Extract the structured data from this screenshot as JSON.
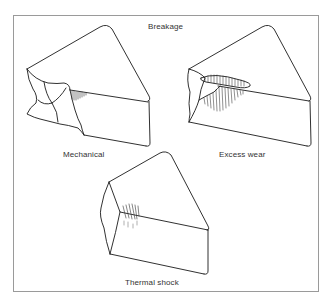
{
  "diagram": {
    "title": "Breakage",
    "panels": [
      {
        "id": "mechanical",
        "label": "Mechanical"
      },
      {
        "id": "excess-wear",
        "label": "Excess wear"
      },
      {
        "id": "thermal-shock",
        "label": "Thermal shock"
      }
    ]
  },
  "colors": {
    "line": "#1a1a1a",
    "frame": "#9a9a9a",
    "hatch": "#333333"
  }
}
